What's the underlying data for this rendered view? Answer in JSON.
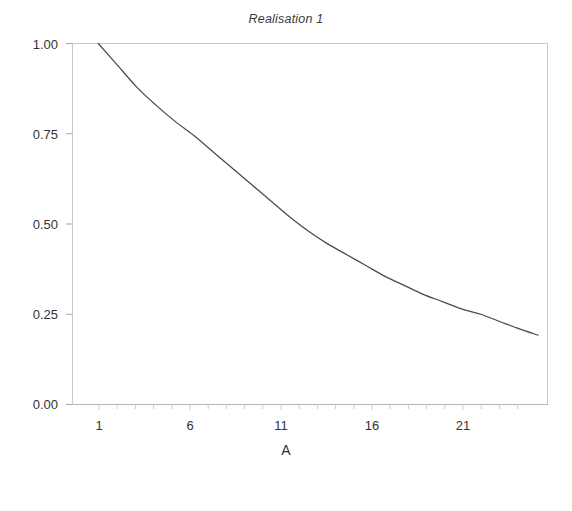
{
  "figure": {
    "title": "Realisation 1",
    "background_color": "#ffffff",
    "line_color": "#4a4a4a",
    "axis_color": "#b9b9b9",
    "text_color": "#333333"
  },
  "chart_data": {
    "type": "line",
    "title": "Realisation 1",
    "xlabel": "A",
    "ylabel": "",
    "xlim": [
      -0.35,
      24.5
    ],
    "ylim": [
      0.0,
      1.0
    ],
    "grid": false,
    "legend": null,
    "x_ticks": [
      1,
      6,
      11,
      16,
      21
    ],
    "x_tick_labels": [
      "1",
      "6",
      "11",
      "16",
      "21"
    ],
    "y_ticks": [
      0.0,
      0.25,
      0.5,
      0.75,
      1.0
    ],
    "y_tick_labels": [
      "0.00",
      "0.25",
      "0.50",
      "0.75",
      "1.00"
    ],
    "x": [
      1,
      2,
      3,
      4,
      5,
      6,
      7,
      8,
      9,
      10,
      11,
      12,
      13,
      14,
      15,
      16,
      17,
      18,
      19,
      20,
      21,
      22,
      23,
      24
    ],
    "series": [
      {
        "name": "Realisation 1",
        "color": "#4a4a4a",
        "values": [
          1.0,
          0.94,
          0.88,
          0.83,
          0.785,
          0.745,
          0.7,
          0.655,
          0.61,
          0.565,
          0.52,
          0.48,
          0.445,
          0.415,
          0.385,
          0.355,
          0.33,
          0.305,
          0.285,
          0.265,
          0.25,
          0.23,
          0.21,
          0.192
        ]
      }
    ]
  },
  "axis": {
    "x_title": "A",
    "y_tick_labels": [
      "1.00",
      "0.75",
      "0.50",
      "0.25",
      "0.00"
    ],
    "x_tick_labels": [
      "1",
      "6",
      "11",
      "16",
      "21"
    ]
  }
}
